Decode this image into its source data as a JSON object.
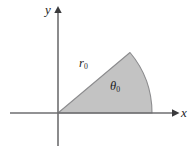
{
  "figure": {
    "kind": "circular-sector-diagram",
    "background_color": "#ffffff",
    "axes": {
      "x_axis_label": "x",
      "y_axis_label": "y",
      "axis_color": "#6e6e70",
      "arrow_color": "#3a3a3c",
      "origin": {
        "x": 58,
        "y": 113
      },
      "x_axis_start": {
        "x": 10,
        "y": 113
      },
      "x_axis_end": {
        "x": 178,
        "y": 113
      },
      "y_axis_top": {
        "x": 58,
        "y": 8
      },
      "y_axis_bottom": {
        "x": 58,
        "y": 146
      }
    },
    "sector": {
      "fill_color": "#c3c3c3",
      "edge_color": "#8c8c8e",
      "radius_label": "r",
      "radius_subscript": "0",
      "angle_label": "θ",
      "angle_subscript": "0",
      "radius_px": 94,
      "start_angle_deg": 0,
      "end_angle_deg": 40,
      "apex": {
        "x": 130,
        "y": 52
      },
      "arc_end_on_x_axis": {
        "x": 152,
        "y": 113
      }
    },
    "labels": {
      "y": "y",
      "x": "x",
      "r0_base": "r",
      "r0_sub": "0",
      "theta0_base": "θ",
      "theta0_sub": "0"
    }
  }
}
